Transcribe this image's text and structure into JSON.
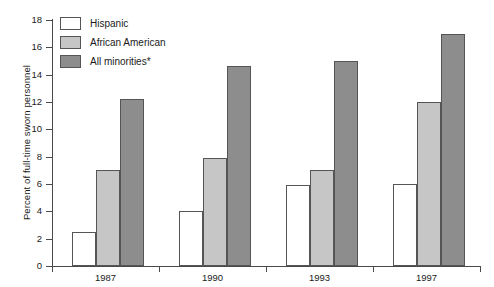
{
  "chart_data": {
    "type": "bar",
    "title": "",
    "subtitle": "",
    "xlabel": "",
    "ylabel": "Percent of full-time sworn personnel",
    "categories": [
      "1987",
      "1990",
      "1993",
      "1997"
    ],
    "series": [
      {
        "name": "Hispanic",
        "color": "#ffffff",
        "values": [
          2.5,
          4.0,
          5.9,
          6.0
        ]
      },
      {
        "name": "African American",
        "color": "#c6c6c6",
        "values": [
          7.0,
          7.9,
          7.0,
          12.0
        ]
      },
      {
        "name": "All minorities*",
        "color": "#8d8d8d",
        "values": [
          12.2,
          14.6,
          15.0,
          17.0
        ]
      }
    ],
    "ylim": [
      0,
      18
    ],
    "ytick_labels": [
      "0",
      "2",
      "4",
      "6",
      "8",
      "10",
      "12",
      "14",
      "16",
      "18"
    ],
    "ytick_values": [
      0,
      2,
      4,
      6,
      8,
      10,
      12,
      14,
      16,
      18
    ],
    "grid": false,
    "legend_position": "top-left",
    "annotations": []
  },
  "axis": {
    "line_color": "#4a4a4a"
  }
}
